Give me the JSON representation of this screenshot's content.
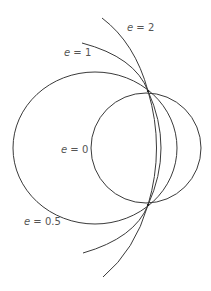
{
  "diagram": {
    "stroke_color": "#3a3a3a",
    "label_color": "#555555",
    "curves": [
      {
        "id": "circle",
        "eccentricity": "0",
        "type": "circle"
      },
      {
        "id": "ellipse",
        "eccentricity": "0.5",
        "type": "ellipse"
      },
      {
        "id": "parabola",
        "eccentricity": "1",
        "type": "parabola"
      },
      {
        "id": "hyperbola",
        "eccentricity": "2",
        "type": "hyperbola"
      }
    ],
    "labels": {
      "e0": {
        "var": "e",
        "eq": " = ",
        "value": "0"
      },
      "e05": {
        "var": "e",
        "eq": " = ",
        "value": "0.5"
      },
      "e1": {
        "var": "e",
        "eq": " = ",
        "value": "1"
      },
      "e2": {
        "var": "e",
        "eq": " = ",
        "value": "2"
      }
    }
  }
}
